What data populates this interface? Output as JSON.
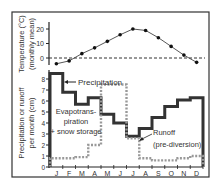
{
  "chart_data": [
    {
      "type": "line",
      "title": "",
      "xlabel": "",
      "ylabel": "Temperature (°C) (monthly mean)",
      "ylabel_lines": [
        "Temperature (°C)",
        "(monthly mean)"
      ],
      "categories": [
        "J",
        "F",
        "M",
        "A",
        "M",
        "J",
        "J",
        "A",
        "S",
        "O",
        "N",
        "D"
      ],
      "series": [
        {
          "name": "Temperature",
          "values": [
            -4,
            -2,
            3,
            7,
            11.5,
            16,
            20,
            19,
            14,
            8,
            2,
            -3
          ],
          "style": "solid-line-with-dots",
          "color": "#111111"
        }
      ],
      "yticks": [
        0,
        10,
        20
      ],
      "ylim": [
        -5,
        23
      ],
      "reference_line": {
        "y": 0,
        "style": "dashed"
      },
      "grid": false
    },
    {
      "type": "line",
      "title": "",
      "xlabel": "",
      "ylabel": "Precipitation or runoff per month (cm)",
      "ylabel_lines": [
        "Precipitation or runoff",
        "per month (cm)"
      ],
      "categories": [
        "J",
        "F",
        "M",
        "A",
        "M",
        "J",
        "J",
        "A",
        "S",
        "O",
        "N",
        "D"
      ],
      "series": [
        {
          "name": "Precipitation",
          "values": [
            8.5,
            6.8,
            5.7,
            6.3,
            4.8,
            4.0,
            2.8,
            3.5,
            4.5,
            5.5,
            6.1,
            6.3
          ],
          "style": "step-solid-thick",
          "color": "#333333"
        },
        {
          "name": "Runoff (pre-diversion)",
          "values": [
            0.8,
            0.8,
            0.9,
            2.0,
            7.5,
            7.5,
            2.6,
            0.8,
            0.6,
            0.6,
            0.8,
            1.0
          ],
          "style": "step-dotted-thick",
          "color": "#999999"
        }
      ],
      "yticks": [
        0,
        1,
        2,
        3,
        4,
        5,
        6,
        7,
        8
      ],
      "ylim": [
        0,
        8.8
      ],
      "annotations": [
        {
          "text": "Precipitation",
          "points_to": "Precipitation"
        },
        {
          "text": "Evapotrans-piration + snow storage",
          "lines": [
            "Evapotrans-",
            "piration",
            "+ snow storage"
          ]
        },
        {
          "text": "Runoff (pre-diversion)",
          "lines": [
            "Runoff",
            "(pre-diversion)"
          ],
          "points_to": "Runoff (pre-diversion)"
        }
      ],
      "grid": false
    }
  ]
}
